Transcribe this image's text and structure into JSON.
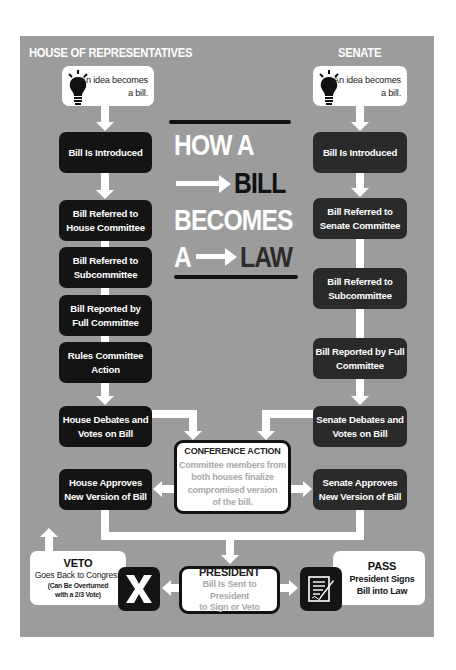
{
  "title": {
    "line1": "HOW A",
    "line2": "BILL",
    "line3": "BECOMES",
    "line4_prefix": "A",
    "line4": "LAW"
  },
  "house": {
    "header": "HOUSE OF REPRESENTATIVES",
    "idea": {
      "line1": "An idea becomes",
      "line2": "a bill."
    },
    "steps": [
      {
        "line1": "Bill Is Introduced",
        "line2": ""
      },
      {
        "line1": "Bill Referred to",
        "line2": "House Committee"
      },
      {
        "line1": "Bill Referred to",
        "line2": "Subcommittee"
      },
      {
        "line1": "Bill Reported by",
        "line2": "Full Committee"
      },
      {
        "line1": "Rules Committee",
        "line2": "Action"
      },
      {
        "line1": "House Debates and",
        "line2": "Votes on Bill"
      },
      {
        "line1": "House Approves",
        "line2": "New Version of Bill"
      }
    ]
  },
  "senate": {
    "header": "SENATE",
    "idea": {
      "line1": "An idea becomes",
      "line2": "a bill."
    },
    "steps": [
      {
        "line1": "Bill Is Introduced",
        "line2": ""
      },
      {
        "line1": "Bill Referred to",
        "line2": "Senate Committee"
      },
      {
        "line1": "Bill Referred to",
        "line2": "Subcommittee"
      },
      {
        "line1": "Bill Reported by Full",
        "line2": "Committee"
      },
      {
        "line1": "Senate Debates and",
        "line2": "Votes on Bill"
      },
      {
        "line1": "Senate Approves",
        "line2": "New Version of Bill"
      }
    ]
  },
  "conference": {
    "title": "CONFERENCE ACTION",
    "body": [
      "Committee members from",
      "both houses finalize",
      "compromised version",
      "of the bill."
    ]
  },
  "president": {
    "title": "PRESIDENT",
    "body": [
      "Bill Is Sent to President",
      "to Sign or Veto"
    ]
  },
  "veto": {
    "title": "VETO",
    "line1": "Goes Back to Congress",
    "note1": "(Can Be Overturned",
    "note2": "with a 2/3 Vote)",
    "icon": "x-icon"
  },
  "pass": {
    "title": "PASS",
    "line1": "President Signs",
    "line2": "Bill into Law",
    "icon": "signed-document-icon"
  },
  "icons": {
    "idea": "lightbulb-icon"
  },
  "colors": {
    "panel": "#9c9c9c",
    "box_dark": "#141414",
    "box_white": "#ffffff",
    "connector": "#ffffff",
    "muted_text": "#a8a8a8"
  }
}
